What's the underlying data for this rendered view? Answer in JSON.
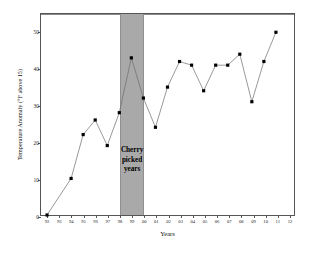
{
  "chart_data": {
    "type": "line",
    "title": "How Cherry Picking Works",
    "xlabel": "Years",
    "ylabel": "Temperature Anomaly (°F above 15)",
    "xlim": [
      0,
      20
    ],
    "ylim": [
      0,
      55
    ],
    "grid": false,
    "legend": "none",
    "categories": [
      "92",
      "93",
      "94",
      "95",
      "96",
      "97",
      "98",
      "99",
      "00",
      "01",
      "02",
      "03",
      "04",
      "05",
      "06",
      "07",
      "08",
      "09",
      "10",
      "11",
      "12"
    ],
    "tick_labels_x": [
      "92",
      "93",
      "94",
      "95",
      "96",
      "97",
      "98",
      "99",
      "00",
      "01",
      "02",
      "03",
      "04",
      "05",
      "06",
      "07",
      "08",
      "09",
      "10",
      "11",
      "12"
    ],
    "tick_labels_y": [
      "0",
      "10",
      "20",
      "30",
      "40",
      "50"
    ],
    "tick_values_y": [
      0,
      10,
      20,
      30,
      40,
      50
    ],
    "series": [
      {
        "name": "Temperature Anomaly",
        "values": [
          0,
          10,
          22,
          26,
          19,
          28,
          43,
          32,
          24,
          35,
          42,
          41,
          34,
          41,
          41,
          44,
          31,
          42,
          50,
          null,
          null
        ]
      }
    ],
    "points": [
      {
        "x": "92",
        "y": 0
      },
      {
        "x": "94",
        "y": 10
      },
      {
        "x": "95",
        "y": 22
      },
      {
        "x": "96",
        "y": 26
      },
      {
        "x": "97",
        "y": 19
      },
      {
        "x": "98",
        "y": 28
      },
      {
        "x": "99",
        "y": 43
      },
      {
        "x": "00",
        "y": 32
      },
      {
        "x": "01",
        "y": 24
      },
      {
        "x": "02",
        "y": 35
      },
      {
        "x": "03",
        "y": 42
      },
      {
        "x": "04",
        "y": 41
      },
      {
        "x": "05",
        "y": 34
      },
      {
        "x": "06",
        "y": 41
      },
      {
        "x": "07",
        "y": 41
      },
      {
        "x": "08",
        "y": 44
      },
      {
        "x": "09",
        "y": 31
      },
      {
        "x": "10",
        "y": 42
      },
      {
        "x": "11",
        "y": 50
      }
    ],
    "annotations": [
      {
        "name": "cherry-picked-band",
        "text": "Cherry\npicked\nyears",
        "x_start": "98",
        "x_end": "00",
        "color": "#a9a9a9"
      }
    ],
    "colors": {
      "line": "#6b6b6b",
      "marker": "#000000",
      "band": "#a9a9a9",
      "frame": "#555555",
      "background": "#ffffff"
    }
  }
}
